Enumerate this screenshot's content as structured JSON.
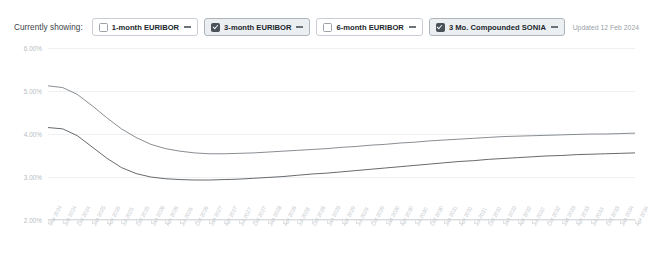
{
  "toolbar": {
    "showing_label": "Currently showing:",
    "updated_text": "Updated 12 Feb 2024",
    "chips": [
      {
        "label": "1-month EURIBOR",
        "checked": false,
        "color": "#6b7278"
      },
      {
        "label": "3-month EURIBOR",
        "checked": true,
        "color": "#6b7278"
      },
      {
        "label": "6-month EURIBOR",
        "checked": false,
        "color": "#6b7278"
      },
      {
        "label": "3 Mo. Compounded SONIA",
        "checked": true,
        "color": "#6b7278"
      }
    ]
  },
  "chart_data": {
    "type": "line",
    "title": "",
    "xlabel": "",
    "ylabel": "",
    "ylim": [
      2.0,
      6.0
    ],
    "ytick_values": [
      6.0,
      5.0,
      4.0,
      3.0,
      2.0
    ],
    "ytick_labels": [
      "6.00%",
      "5.00%",
      "4.00%",
      "3.00%",
      "2.00%"
    ],
    "grid": true,
    "legend_position": "top",
    "x": [
      "Mar 2024",
      "Jun 2024",
      "Oct 2024",
      "Jan 2025",
      "Apr 2025",
      "Jul 2025",
      "Oct 2025",
      "Jan 2026",
      "Apr 2026",
      "Jul 2026",
      "Oct 2026",
      "Jan 2027",
      "Apr 2027",
      "Jul 2027",
      "Oct 2027",
      "Jan 2028",
      "Apr 2028",
      "Jul 2028",
      "Oct 2028",
      "Jan 2029",
      "Apr 2029",
      "Jul 2029",
      "Oct 2029",
      "Jan 2030",
      "Apr 2030",
      "Jul 2030",
      "Oct 2030",
      "Jan 2031",
      "Apr 2031",
      "Jul 2031",
      "Oct 2031",
      "Jan 2032",
      "Apr 2032",
      "Jul 2032",
      "Oct 2032",
      "Jan 2033",
      "Apr 2033",
      "Jul 2033",
      "Oct 2033",
      "Jan 2034",
      "Apr 2034"
    ],
    "series": [
      {
        "name": "3 Mo. Compounded SONIA",
        "color": "#7a8086",
        "values": [
          5.12,
          5.08,
          4.92,
          4.66,
          4.38,
          4.12,
          3.92,
          3.76,
          3.66,
          3.6,
          3.56,
          3.54,
          3.54,
          3.55,
          3.56,
          3.58,
          3.6,
          3.62,
          3.64,
          3.66,
          3.69,
          3.71,
          3.74,
          3.76,
          3.79,
          3.81,
          3.84,
          3.86,
          3.88,
          3.9,
          3.92,
          3.94,
          3.95,
          3.96,
          3.97,
          3.98,
          3.99,
          4.0,
          4.0,
          4.01,
          4.02
        ]
      },
      {
        "name": "3-month EURIBOR",
        "color": "#55595e",
        "values": [
          4.15,
          4.12,
          3.96,
          3.7,
          3.44,
          3.22,
          3.08,
          3.0,
          2.96,
          2.94,
          2.93,
          2.93,
          2.94,
          2.95,
          2.97,
          2.99,
          3.01,
          3.04,
          3.07,
          3.09,
          3.12,
          3.15,
          3.18,
          3.21,
          3.24,
          3.27,
          3.3,
          3.33,
          3.36,
          3.38,
          3.41,
          3.43,
          3.45,
          3.47,
          3.49,
          3.5,
          3.52,
          3.53,
          3.54,
          3.55,
          3.56
        ]
      }
    ]
  }
}
